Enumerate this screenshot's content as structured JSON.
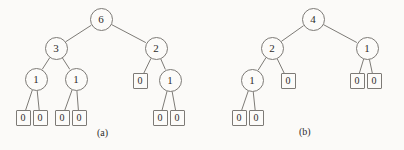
{
  "figure": {
    "width": 404,
    "height": 150,
    "background_color": "#fbfaf8",
    "stroke_color": "#7d7a76",
    "text_color": "#2e2c2b"
  },
  "chart_data": {
    "type": "diagram",
    "title": "",
    "subtitle": "",
    "xlabel": "",
    "ylabel": "",
    "panels": [
      {
        "id": "a",
        "caption": "(a)",
        "caption_x": 97,
        "caption_y": 128,
        "nodes": [
          {
            "id": "a-root",
            "label": "6",
            "shape": "circle",
            "cx": 101,
            "cy": 19,
            "depth": 0
          },
          {
            "id": "a-l",
            "label": "3",
            "shape": "circle",
            "cx": 56,
            "cy": 48,
            "depth": 1
          },
          {
            "id": "a-r",
            "label": "2",
            "shape": "circle",
            "cx": 156,
            "cy": 48,
            "depth": 1
          },
          {
            "id": "a-ll",
            "label": "1",
            "shape": "circle",
            "cx": 36,
            "cy": 79,
            "depth": 2
          },
          {
            "id": "a-lr",
            "label": "1",
            "shape": "circle",
            "cx": 76,
            "cy": 79,
            "depth": 2
          },
          {
            "id": "a-rl",
            "label": "0",
            "shape": "box",
            "cx": 140,
            "cy": 81,
            "depth": 2
          },
          {
            "id": "a-rr",
            "label": "1",
            "shape": "circle",
            "cx": 170,
            "cy": 80,
            "depth": 2
          },
          {
            "id": "a-lll",
            "label": "0",
            "shape": "box",
            "cx": 23,
            "cy": 118,
            "depth": 3
          },
          {
            "id": "a-llr",
            "label": "0",
            "shape": "box",
            "cx": 40,
            "cy": 118,
            "depth": 3
          },
          {
            "id": "a-lrl",
            "label": "0",
            "shape": "box",
            "cx": 62,
            "cy": 118,
            "depth": 3
          },
          {
            "id": "a-lrr",
            "label": "0",
            "shape": "box",
            "cx": 79,
            "cy": 118,
            "depth": 3
          },
          {
            "id": "a-rrl",
            "label": "0",
            "shape": "box",
            "cx": 160,
            "cy": 118,
            "depth": 3
          },
          {
            "id": "a-rrr",
            "label": "0",
            "shape": "box",
            "cx": 177,
            "cy": 118,
            "depth": 3
          }
        ],
        "edges": [
          [
            "a-root",
            "a-l"
          ],
          [
            "a-root",
            "a-r"
          ],
          [
            "a-l",
            "a-ll"
          ],
          [
            "a-l",
            "a-lr"
          ],
          [
            "a-r",
            "a-rl"
          ],
          [
            "a-r",
            "a-rr"
          ],
          [
            "a-ll",
            "a-lll"
          ],
          [
            "a-ll",
            "a-llr"
          ],
          [
            "a-lr",
            "a-lrl"
          ],
          [
            "a-lr",
            "a-lrr"
          ],
          [
            "a-rr",
            "a-rrl"
          ],
          [
            "a-rr",
            "a-rrr"
          ]
        ]
      },
      {
        "id": "b",
        "caption": "(b)",
        "caption_x": 299,
        "caption_y": 127,
        "nodes": [
          {
            "id": "b-root",
            "label": "4",
            "shape": "circle",
            "cx": 313,
            "cy": 19,
            "depth": 0
          },
          {
            "id": "b-l",
            "label": "2",
            "shape": "circle",
            "cx": 272,
            "cy": 48,
            "depth": 1
          },
          {
            "id": "b-r",
            "label": "1",
            "shape": "circle",
            "cx": 367,
            "cy": 48,
            "depth": 1
          },
          {
            "id": "b-ll",
            "label": "1",
            "shape": "circle",
            "cx": 252,
            "cy": 80,
            "depth": 2
          },
          {
            "id": "b-lr",
            "label": "0",
            "shape": "box",
            "cx": 288,
            "cy": 81,
            "depth": 2
          },
          {
            "id": "b-rl",
            "label": "0",
            "shape": "box",
            "cx": 357,
            "cy": 81,
            "depth": 2
          },
          {
            "id": "b-rr",
            "label": "0",
            "shape": "box",
            "cx": 374,
            "cy": 81,
            "depth": 2
          },
          {
            "id": "b-lll",
            "label": "0",
            "shape": "box",
            "cx": 239,
            "cy": 118,
            "depth": 3
          },
          {
            "id": "b-llr",
            "label": "0",
            "shape": "box",
            "cx": 256,
            "cy": 118,
            "depth": 3
          }
        ],
        "edges": [
          [
            "b-root",
            "b-l"
          ],
          [
            "b-root",
            "b-r"
          ],
          [
            "b-l",
            "b-ll"
          ],
          [
            "b-l",
            "b-lr"
          ],
          [
            "b-r",
            "b-rl"
          ],
          [
            "b-r",
            "b-rr"
          ],
          [
            "b-ll",
            "b-lll"
          ],
          [
            "b-ll",
            "b-llr"
          ]
        ]
      }
    ]
  }
}
